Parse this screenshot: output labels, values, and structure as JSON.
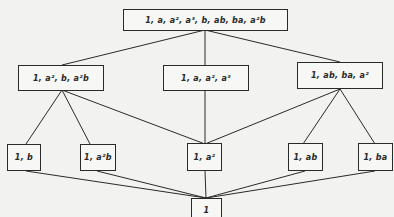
{
  "diagram": {
    "type": "subgroup-lattice",
    "nodes": [
      {
        "id": "top",
        "label": "1, a, a², a³, b, ab, ba, a²b"
      },
      {
        "id": "mid_left",
        "label": "1, a², b, a²b"
      },
      {
        "id": "mid_center",
        "label": "1, a, a², a³"
      },
      {
        "id": "mid_right",
        "label": "1, ab, ba, a²"
      },
      {
        "id": "low_b",
        "label": "1, b"
      },
      {
        "id": "low_a2b",
        "label": "1, a²b"
      },
      {
        "id": "low_a2",
        "label": "1, a²"
      },
      {
        "id": "low_ab",
        "label": "1, ab"
      },
      {
        "id": "low_ba",
        "label": "1, ba"
      },
      {
        "id": "bottom",
        "label": "1"
      }
    ],
    "edges": [
      [
        "top",
        "mid_left"
      ],
      [
        "top",
        "mid_center"
      ],
      [
        "top",
        "mid_right"
      ],
      [
        "mid_left",
        "low_b"
      ],
      [
        "mid_left",
        "low_a2b"
      ],
      [
        "mid_left",
        "low_a2"
      ],
      [
        "mid_center",
        "low_a2"
      ],
      [
        "mid_right",
        "low_a2"
      ],
      [
        "mid_right",
        "low_ab"
      ],
      [
        "mid_right",
        "low_ba"
      ],
      [
        "low_b",
        "bottom"
      ],
      [
        "low_a2b",
        "bottom"
      ],
      [
        "low_a2",
        "bottom"
      ],
      [
        "low_ab",
        "bottom"
      ],
      [
        "low_ba",
        "bottom"
      ]
    ],
    "caption": "Figure 5"
  }
}
